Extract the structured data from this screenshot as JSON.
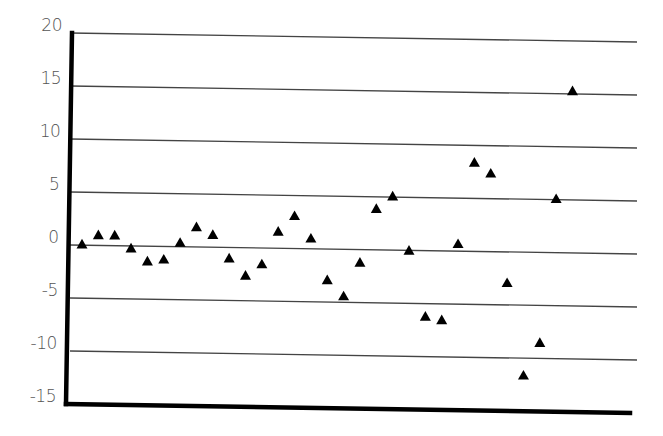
{
  "chart_data": {
    "type": "scatter",
    "title": "",
    "xlabel": "",
    "ylabel": "",
    "marker": "triangle",
    "marker_color": "#000000",
    "grid": true,
    "legend": null,
    "ylim": [
      -15,
      20
    ],
    "yticks": [
      20,
      15,
      10,
      5,
      0,
      -5,
      -10,
      -15
    ],
    "ytick_labels": [
      "20",
      "15",
      "10",
      "5",
      "0",
      "-5",
      "-10",
      "-15"
    ],
    "xticks": [],
    "x": [
      1,
      2,
      3,
      4,
      5,
      6,
      7,
      8,
      9,
      10,
      11,
      12,
      13,
      14,
      15,
      16,
      17,
      18,
      19,
      20,
      21,
      22,
      23,
      24,
      25,
      26,
      27,
      28,
      29,
      30,
      31
    ],
    "y": [
      0.0,
      0.9,
      0.9,
      -0.3,
      -1.5,
      -1.3,
      0.3,
      1.8,
      1.1,
      -1.1,
      -2.7,
      -1.6,
      1.5,
      3.0,
      0.9,
      -3.0,
      -4.5,
      -1.3,
      3.8,
      5.0,
      -0.1,
      -6.3,
      -6.6,
      0.6,
      8.3,
      7.3,
      -3.0,
      -11.7,
      -8.6,
      5.0,
      15.2
    ]
  },
  "layout": {
    "plot_left": 70,
    "plot_right": 637,
    "y_top_px_left": 33,
    "y_bottom_px_left": 404,
    "tilt_px": 9,
    "x_first_px": 82,
    "x_step_px": 16.35,
    "axis_color": "#000000",
    "grid_color": "#444444",
    "label_color": "#555555"
  }
}
